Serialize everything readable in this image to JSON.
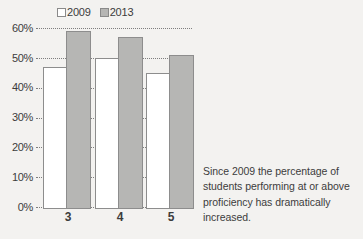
{
  "chart_data": {
    "type": "bar",
    "title": "",
    "subtitle": "",
    "xlabel": "",
    "ylabel": "",
    "categories": [
      "3",
      "4",
      "5"
    ],
    "series": [
      {
        "name": "2009",
        "values": [
          47,
          50,
          45
        ],
        "color": "#ffffff"
      },
      {
        "name": "2013",
        "values": [
          59,
          57,
          51
        ],
        "color": "#b6b6b4"
      }
    ],
    "ylim": [
      0,
      60
    ],
    "ytick_values": [
      60,
      50,
      40,
      30,
      20,
      10,
      0
    ],
    "ytick_labels": [
      "60%",
      "50%",
      "40%",
      "30%",
      "20%",
      "10%",
      "0%"
    ],
    "grid": true,
    "grid_style": "dotted",
    "legend_position": "top-center",
    "legend_entries": [
      "2009",
      "2013"
    ],
    "annotations": []
  },
  "legend": {
    "entries": [
      {
        "label": "2009",
        "swatch": "legend-swatch-2009"
      },
      {
        "label": "2013",
        "swatch": "legend-swatch-2013"
      }
    ]
  },
  "axis": {
    "y_labels": [
      "60%",
      "50%",
      "40%",
      "30%",
      "20%",
      "10%",
      "0%"
    ],
    "x_labels": [
      "3",
      "4",
      "5"
    ]
  },
  "caption": {
    "text": "Since 2009 the percentage of students performing at or above proficiency has dramatically increased."
  },
  "colors": {
    "background": "#f3f2f0",
    "series_2009": "#ffffff",
    "series_2013": "#b6b6b4",
    "bar_border": "#8d8d8d",
    "gridline": "#7e7e7e",
    "text": "#3c3c3c"
  }
}
